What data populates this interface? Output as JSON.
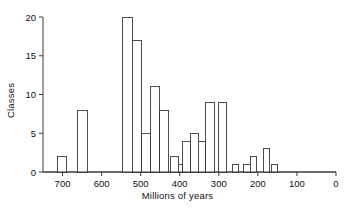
{
  "chart_data": {
    "type": "bar",
    "title": "",
    "subtitle": "",
    "xlabel": "Millions of years",
    "ylabel": "Classes",
    "xlim": [
      750,
      0
    ],
    "ylim": [
      0,
      20
    ],
    "x_reversed": true,
    "grid": false,
    "legend": null,
    "xticks": [
      700,
      600,
      500,
      400,
      300,
      200,
      100,
      0
    ],
    "xtick_labels": [
      "700",
      "600",
      "500",
      "400",
      "300",
      "200",
      "100",
      "0"
    ],
    "yticks": [
      0,
      5,
      10,
      15,
      20
    ],
    "ytick_labels": [
      "0",
      "5",
      "10",
      "15",
      "20"
    ],
    "bin_label": "Millions of years before present",
    "bars": [
      {
        "start": 712,
        "end": 690,
        "value": 2
      },
      {
        "start": 662,
        "end": 637,
        "value": 8
      },
      {
        "start": 547,
        "end": 522,
        "value": 20
      },
      {
        "start": 522,
        "end": 497,
        "value": 17
      },
      {
        "start": 497,
        "end": 474,
        "value": 5
      },
      {
        "start": 474,
        "end": 451,
        "value": 11
      },
      {
        "start": 451,
        "end": 428,
        "value": 8
      },
      {
        "start": 424,
        "end": 404,
        "value": 2
      },
      {
        "start": 404,
        "end": 392,
        "value": 1
      },
      {
        "start": 392,
        "end": 372,
        "value": 4
      },
      {
        "start": 372,
        "end": 352,
        "value": 5
      },
      {
        "start": 352,
        "end": 334,
        "value": 4
      },
      {
        "start": 334,
        "end": 312,
        "value": 9
      },
      {
        "start": 300,
        "end": 281,
        "value": 9
      },
      {
        "start": 266,
        "end": 250,
        "value": 1
      },
      {
        "start": 236,
        "end": 219,
        "value": 1
      },
      {
        "start": 219,
        "end": 203,
        "value": 2
      },
      {
        "start": 186,
        "end": 170,
        "value": 3
      },
      {
        "start": 166,
        "end": 150,
        "value": 1
      }
    ],
    "colors": {
      "bar_fill": "#ffffff",
      "bar_stroke": "#3a3a3a",
      "axis": "#3a3a3a",
      "text": "#111111",
      "background": "#ffffff"
    }
  }
}
